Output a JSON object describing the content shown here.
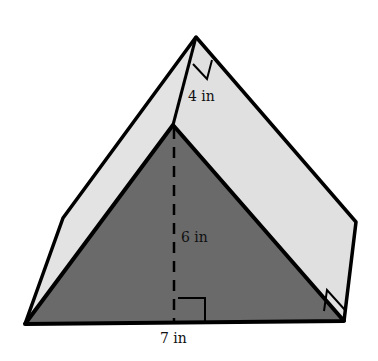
{
  "figure": {
    "type": "triangular prism",
    "colors": {
      "front_face": "#6a6a6a",
      "side_faces": "#e2e2e2",
      "edges": "#000000",
      "background": "#ffffff"
    },
    "labels": {
      "slant_length": "4 in",
      "height": "6 in",
      "base": "7 in"
    }
  }
}
